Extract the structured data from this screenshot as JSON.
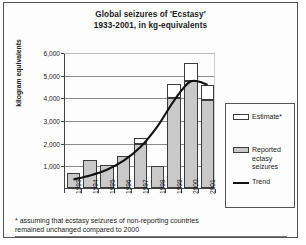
{
  "chart_data": {
    "type": "bar",
    "title": "Global seizures of 'Ecstasy'",
    "subtitle": "1933-2001, in kg-equivalents",
    "xlabel": "",
    "ylabel": "kilogram equivalents",
    "ylim": [
      0,
      6000
    ],
    "ytick_labels": [
      "6,000",
      "5,000",
      "4,000",
      "3,000",
      "2,000",
      "1,000"
    ],
    "ytick_values": [
      6000,
      5000,
      4000,
      3000,
      2000,
      1000
    ],
    "grid": true,
    "stacked": true,
    "legend_position": "right",
    "categories": [
      "1993",
      "1994",
      "1995",
      "1996",
      "1997",
      "1998",
      "1999",
      "2000",
      "2001"
    ],
    "series": [
      {
        "name": "Reported ecstasy seizures",
        "color": "#c9c9c9",
        "values": [
          650,
          1250,
          1000,
          1400,
          1950,
          950,
          3950,
          4700,
          3900
        ]
      },
      {
        "name": "Estimate*",
        "color": "#ffffff",
        "values": [
          0,
          0,
          0,
          0,
          250,
          0,
          650,
          800,
          650
        ]
      }
    ],
    "totals": [
      650,
      1250,
      1000,
      1400,
      2200,
      950,
      4600,
      5500,
      4550
    ],
    "trend": {
      "name": "Trend",
      "color": "#111111",
      "values": [
        420,
        600,
        850,
        1250,
        1850,
        2750,
        3900,
        4750,
        4600
      ]
    },
    "legend": [
      {
        "label": "Estimate*",
        "swatch": "estimate"
      },
      {
        "label": "Reported\nectasy\nseizures",
        "swatch": "reported"
      },
      {
        "label": "Trend",
        "swatch": "trend"
      }
    ],
    "legend_items": {
      "estimate": "Estimate*",
      "reported_line1": "Reported",
      "reported_line2": "ectasy",
      "reported_line3": "seizures",
      "trend": "Trend"
    },
    "footnote_line1": "* assuming that ecstasy seizures of non-reporting countries",
    "footnote_line2": "remained unchanged compared to 2000"
  }
}
